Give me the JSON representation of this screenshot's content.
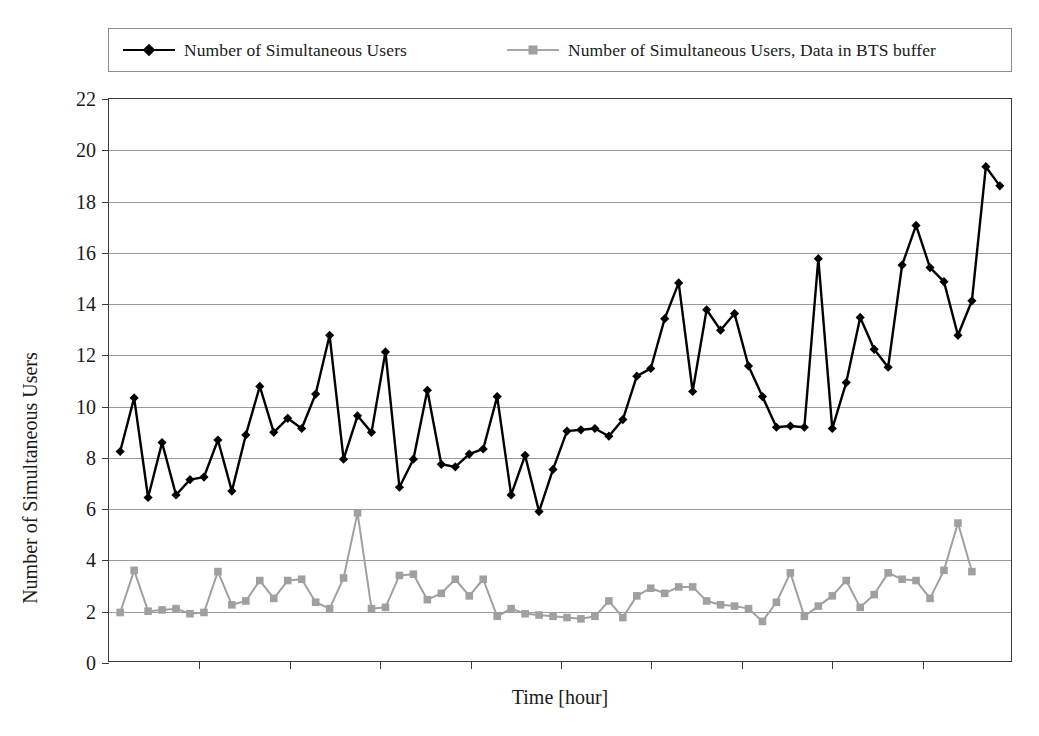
{
  "chart_data": {
    "type": "line",
    "title": "",
    "xlabel": "Time [hour]",
    "ylabel": "Number of Simultaneous Users",
    "ylim": [
      0,
      22
    ],
    "ytick_step": 2,
    "yticks": [
      0,
      2,
      4,
      6,
      8,
      10,
      12,
      14,
      16,
      18,
      20,
      22
    ],
    "xticks_labels": [],
    "x_tick_count": 9,
    "grid": "horizontal",
    "legend_position": "top",
    "series": [
      {
        "name": "Number of Simultaneous Users",
        "color": "#000000",
        "marker": "diamond",
        "values": [
          8.2,
          10.3,
          6.4,
          8.55,
          6.5,
          7.1,
          7.2,
          8.65,
          6.65,
          8.85,
          10.75,
          8.95,
          9.5,
          9.1,
          10.45,
          12.75,
          7.9,
          9.6,
          8.95,
          12.1,
          6.8,
          7.9,
          10.6,
          7.7,
          7.6,
          8.1,
          8.3,
          10.35,
          6.5,
          8.05,
          5.85,
          7.5,
          9.0,
          9.05,
          9.1,
          8.8,
          9.45,
          11.15,
          11.45,
          13.4,
          14.8,
          10.55,
          13.75,
          12.95,
          13.6,
          11.55,
          10.35,
          9.15,
          9.2,
          9.15,
          15.75,
          9.1,
          10.9,
          13.45,
          12.2,
          11.5,
          15.5,
          17.05,
          15.4,
          14.85,
          12.75,
          14.1,
          19.35,
          18.6
        ]
      },
      {
        "name": "Number of Simultaneous Users, Data in BTS buffer",
        "color": "#a0a0a0",
        "marker": "square",
        "values": [
          1.9,
          3.55,
          1.95,
          2.0,
          2.05,
          1.85,
          1.9,
          3.5,
          2.2,
          2.35,
          3.15,
          2.45,
          3.15,
          3.2,
          2.3,
          2.05,
          3.25,
          5.8,
          2.05,
          2.1,
          3.35,
          3.4,
          2.4,
          2.65,
          3.2,
          2.55,
          3.2,
          1.75,
          2.05,
          1.85,
          1.8,
          1.75,
          1.7,
          1.65,
          1.75,
          2.35,
          1.7,
          2.55,
          2.85,
          2.65,
          2.9,
          2.9,
          2.35,
          2.2,
          2.15,
          2.05,
          1.55,
          2.3,
          3.45,
          1.75,
          2.15,
          2.55,
          3.15,
          2.1,
          2.6,
          3.45,
          3.2,
          3.15,
          2.45,
          3.55,
          5.4,
          3.5
        ]
      }
    ]
  },
  "legend": {
    "entries": [
      {
        "label": "Number of Simultaneous Users",
        "marker": "diamond-marker-icon",
        "color": "#000000"
      },
      {
        "label": "Number of Simultaneous Users, Data in BTS buffer",
        "marker": "square-marker-icon",
        "color": "#a0a0a0"
      }
    ]
  },
  "axes": {
    "x_title": "Time [hour]",
    "y_title": "Number of Simultaneous Users",
    "y_labels": [
      "22",
      "20",
      "18",
      "16",
      "14",
      "12",
      "10",
      "8",
      "6",
      "4",
      "2",
      "0"
    ]
  }
}
